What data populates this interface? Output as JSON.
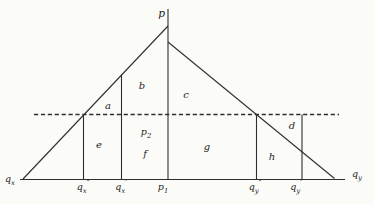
{
  "figure": {
    "colors": {
      "background": "#fbfbf8",
      "line": "#2f2f2f",
      "text": "#1e1e1e"
    },
    "axis_labels": {
      "price": "p",
      "quantity_left": {
        "base": "q",
        "sub": "x"
      },
      "quantity_right": {
        "base": "q",
        "sub": "y"
      }
    },
    "region_labels": {
      "a": "a",
      "b": "b",
      "c": "c",
      "d": "d",
      "e": "e",
      "f": "f",
      "g": "g",
      "h": "h"
    },
    "point_labels": {
      "p2": {
        "base": "p",
        "sub": "2"
      },
      "p1": {
        "base": "p",
        "sub": "1"
      },
      "qx_double_prime": {
        "base": "q",
        "sub": "x",
        "mark": "″"
      },
      "qx_prime": {
        "base": "q",
        "sub": "x",
        "mark": "′"
      },
      "qy_double_prime": {
        "base": "q",
        "sub": "y",
        "mark": "″"
      },
      "qy_prime": {
        "base": "q",
        "sub": "y",
        "mark": "′"
      }
    }
  }
}
